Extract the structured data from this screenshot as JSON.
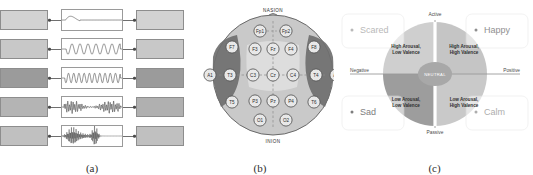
{
  "figure": {
    "panels": [
      {
        "id": "a",
        "caption": "(a)",
        "title": "EEG frequency bands and mental states"
      },
      {
        "id": "b",
        "caption": "(b)",
        "title": "10-20 EEG electrode placement"
      },
      {
        "id": "c",
        "caption": "(c)",
        "title": "Valence-arousal emotion model"
      }
    ]
  },
  "panel_a": {
    "bands": [
      {
        "name": "DELTA",
        "range": "(0.5-4 HZ)",
        "state": "DEEP SLEEP",
        "band_shade": "#d2d2d2",
        "state_shade": "#d2d2d2",
        "wave": "delta"
      },
      {
        "name": "THETA",
        "range": "(4-8 HZ)",
        "state": "LIGHT SLEEP",
        "band_shade": "#c8c8c8",
        "state_shade": "#c8c8c8",
        "wave": "theta"
      },
      {
        "name": "ALPHA",
        "range": "(8-12 HZ)",
        "state": "RELAXED",
        "band_shade": "#9b9b9b",
        "state_shade": "#9b9b9b",
        "wave": "alpha"
      },
      {
        "name": "BETA",
        "range": "(12-30 HZ)",
        "state": "ALERT",
        "band_shade": "#b4b4b4",
        "state_shade": "#b0b0b0",
        "wave": "beta"
      },
      {
        "name": "GAMMA",
        "range": "(30+ HZ)",
        "state": "HIGH ALERT",
        "band_shade": "#c0c0c0",
        "state_shade": "#c0c0c0",
        "wave": "gamma"
      }
    ]
  },
  "panel_b": {
    "nasion_label": "NASION",
    "inion_label": "INION",
    "electrodes": [
      {
        "name": "Fp1",
        "x": 74,
        "y": 29
      },
      {
        "name": "Fp2",
        "x": 100,
        "y": 29
      },
      {
        "name": "F7",
        "x": 46,
        "y": 45
      },
      {
        "name": "F3",
        "x": 69,
        "y": 47
      },
      {
        "name": "Fz",
        "x": 87,
        "y": 47
      },
      {
        "name": "F4",
        "x": 105,
        "y": 47
      },
      {
        "name": "F8",
        "x": 128,
        "y": 45
      },
      {
        "name": "A1",
        "x": 24,
        "y": 73
      },
      {
        "name": "T3",
        "x": 44,
        "y": 73
      },
      {
        "name": "C3",
        "x": 67,
        "y": 73
      },
      {
        "name": "Cz",
        "x": 87,
        "y": 73
      },
      {
        "name": "C4",
        "x": 107,
        "y": 73
      },
      {
        "name": "T4",
        "x": 130,
        "y": 73
      },
      {
        "name": "A2",
        "x": 150,
        "y": 73
      },
      {
        "name": "T5",
        "x": 46,
        "y": 100
      },
      {
        "name": "P3",
        "x": 69,
        "y": 99
      },
      {
        "name": "Pz",
        "x": 87,
        "y": 99
      },
      {
        "name": "P4",
        "x": 105,
        "y": 99
      },
      {
        "name": "T6",
        "x": 128,
        "y": 100
      },
      {
        "name": "O1",
        "x": 74,
        "y": 118
      },
      {
        "name": "O2",
        "x": 100,
        "y": 118
      }
    ],
    "colors": {
      "scalp": "#c9c9c9",
      "temporal": "#6f6f6f",
      "central": "#dedede",
      "node_fill": "#e8e8e8",
      "node_stroke": "#555555"
    }
  },
  "panel_c": {
    "axes": {
      "top": "Active",
      "bottom": "Passive",
      "left": "Negative",
      "right": "Positive"
    },
    "center_label": "NEUTRAL",
    "emotions": [
      {
        "name": "Scared",
        "position": "top-left",
        "color": "#b9b9b9"
      },
      {
        "name": "Happy",
        "position": "top-right",
        "color": "#8f8f8f"
      },
      {
        "name": "Sad",
        "position": "bottom-left",
        "color": "#7d7d7d"
      },
      {
        "name": "Calm",
        "position": "bottom-right",
        "color": "#adadad"
      }
    ],
    "quadrants": [
      {
        "position": "top-left",
        "line1": "High Arousal,",
        "line2": "Low Valence",
        "fill": "#cfcfcf"
      },
      {
        "position": "top-right",
        "line1": "High Arousal,",
        "line2": "High Valence",
        "fill": "#c5c5c5"
      },
      {
        "position": "bottom-left",
        "line1": "Low Arousal,",
        "line2": "Low Valence",
        "fill": "#9d9d9d"
      },
      {
        "position": "bottom-right",
        "line1": "Low Arousal,",
        "line2": "High Valence",
        "fill": "#c9c9c9"
      }
    ]
  }
}
